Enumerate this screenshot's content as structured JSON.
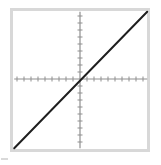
{
  "colors": {
    "background": "#ffffff",
    "frame": "#d8d8d8",
    "axis": "#8f8f8f",
    "line": "#1f1f1f",
    "artifact": "#cfcfcf"
  },
  "chart_data": {
    "type": "line",
    "title": "",
    "xlabel": "",
    "ylabel": "",
    "grid": false,
    "legend": "none",
    "x_range": [
      -9.4,
      9.6
    ],
    "y_range": [
      -9.9,
      9.6
    ],
    "x_ticks": [
      -9,
      -8,
      -7,
      -6,
      -5,
      -4,
      -3,
      -2,
      -1,
      1,
      2,
      3,
      4,
      5,
      6,
      7,
      8,
      9
    ],
    "y_ticks": [
      -9,
      -8,
      -7,
      -6,
      -5,
      -4,
      -3,
      -2,
      -1,
      1,
      2,
      3,
      4,
      5,
      6,
      7,
      8,
      9
    ],
    "tick_labels_shown": false,
    "series": [
      {
        "name": "y = x",
        "slope": 1,
        "intercept": 0,
        "points": [
          [
            -9.4,
            -9.9
          ],
          [
            9.6,
            9.6
          ]
        ]
      }
    ]
  }
}
